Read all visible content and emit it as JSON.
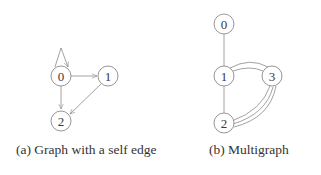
{
  "figures": [
    {
      "id": "a",
      "caption": "(a) Graph with a self edge",
      "nodes": [
        {
          "id": "0",
          "label": "0"
        },
        {
          "id": "1",
          "label": "1"
        },
        {
          "id": "2",
          "label": "2"
        }
      ],
      "edges": [
        {
          "from": "0",
          "to": "0",
          "type": "self-loop",
          "directed": true
        },
        {
          "from": "0",
          "to": "1",
          "directed": true
        },
        {
          "from": "0",
          "to": "2",
          "directed": true
        },
        {
          "from": "1",
          "to": "2",
          "directed": true
        }
      ]
    },
    {
      "id": "b",
      "caption": "(b) Multigraph",
      "nodes": [
        {
          "id": "0",
          "label": "0"
        },
        {
          "id": "1",
          "label": "1"
        },
        {
          "id": "2",
          "label": "2"
        },
        {
          "id": "3",
          "label": "3"
        }
      ],
      "edges": [
        {
          "from": "0",
          "to": "1",
          "multiplicity": 1
        },
        {
          "from": "1",
          "to": "2",
          "multiplicity": 1
        },
        {
          "from": "1",
          "to": "3",
          "multiplicity": 2
        },
        {
          "from": "3",
          "to": "2",
          "multiplicity": 3
        }
      ]
    }
  ],
  "colors": {
    "stroke": "#8a8a8a",
    "text": "#333333",
    "background": "#ffffff"
  }
}
